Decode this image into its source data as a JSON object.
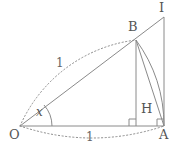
{
  "figure": {
    "kind": "geometry-diagram",
    "background_color": "#ffffff",
    "stroke_color": "#808080",
    "dotted_stroke_color": "#8a8a8a",
    "label_color": "#555555"
  },
  "points": [
    {
      "id": "O",
      "label": "O",
      "x": 20,
      "y": 126,
      "label_x": 10,
      "label_y": 130
    },
    {
      "id": "A",
      "label": "A",
      "x": 164,
      "y": 126,
      "label_x": 160,
      "label_y": 130
    },
    {
      "id": "B",
      "label": "B",
      "x": 136,
      "y": 40,
      "label_x": 128,
      "label_y": 21
    },
    {
      "id": "H",
      "label": "H",
      "x": 136,
      "y": 126,
      "label_x": 141,
      "label_y": 103
    },
    {
      "id": "I",
      "label": "I",
      "x": 164,
      "y": 17,
      "label_x": 160,
      "label_y": 2
    }
  ],
  "segments": [
    {
      "id": "OA",
      "from": "O",
      "to": "A",
      "style": "solid"
    },
    {
      "id": "OI",
      "from": "O",
      "to": "I",
      "style": "solid"
    },
    {
      "id": "AI",
      "from": "A",
      "to": "I",
      "style": "solid"
    },
    {
      "id": "BH",
      "from": "B",
      "to": "H",
      "style": "solid"
    },
    {
      "id": "BA",
      "from": "B",
      "to": "A",
      "style": "solid"
    }
  ],
  "arcs": [
    {
      "id": "arc-OB",
      "label": "1",
      "style": "dotted",
      "from": "O",
      "to": "B",
      "label_x": 58,
      "label_y": 62
    },
    {
      "id": "arc-OA",
      "label": "1",
      "style": "dotted",
      "from": "O",
      "to": "A",
      "label_x": 88,
      "label_y": 136
    },
    {
      "id": "arc-BA",
      "label": "",
      "style": "solid",
      "from": "B",
      "to": "A"
    }
  ],
  "angle": {
    "id": "angle-x",
    "label": "x",
    "vertex": "O",
    "label_x": 36,
    "label_y": 108
  },
  "right_angles": [
    {
      "id": "right-angle-H",
      "at": "H",
      "x": 129,
      "y": 119
    },
    {
      "id": "right-angle-A",
      "at": "A",
      "x": 157,
      "y": 119
    }
  ]
}
